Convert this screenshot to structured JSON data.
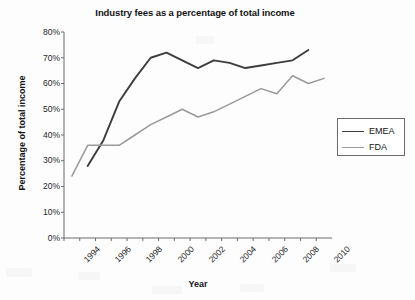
{
  "chart_data": {
    "type": "line",
    "title": "Industry fees as a percentage of total income",
    "xlabel": "Year",
    "ylabel": "Percentage of total income",
    "xlim": [
      1994,
      2011
    ],
    "ylim": [
      0,
      80
    ],
    "yticks": [
      "0%",
      "10%",
      "20%",
      "30%",
      "40%",
      "50%",
      "60%",
      "70%",
      "80%"
    ],
    "ytick_values": [
      0,
      10,
      20,
      30,
      40,
      50,
      60,
      70,
      80
    ],
    "xticks": [
      "1994",
      "1996",
      "1998",
      "2000",
      "2002",
      "2004",
      "2006",
      "2008",
      "2010"
    ],
    "xtick_values": [
      1994,
      1996,
      1998,
      2000,
      2002,
      2004,
      2006,
      2008,
      2010
    ],
    "grid": false,
    "legend_position": "right",
    "series": [
      {
        "name": "EMEA",
        "color": "#3d3d3d",
        "line_width": 1.9,
        "x": [
          1995.5,
          1996.5,
          1997.5,
          1998.5,
          1999.5,
          2000.5,
          2001.5,
          2002.5,
          2003.5,
          2004.5,
          2005.5,
          2006.5,
          2007.5,
          2008.5,
          2009.5
        ],
        "values": [
          28,
          38,
          53,
          62,
          70,
          72,
          69,
          66,
          69,
          68,
          66,
          67,
          68,
          69,
          73
        ]
      },
      {
        "name": "FDA",
        "color": "#9a9a9a",
        "line_width": 1.5,
        "x": [
          1994.5,
          1995.5,
          1996.5,
          1997.5,
          1998.5,
          1999.5,
          2000.5,
          2001.5,
          2002.5,
          2003.5,
          2004.5,
          2005.5,
          2006.5,
          2007.5,
          2008.5,
          2009.5,
          2010.5
        ],
        "values": [
          24,
          36,
          36,
          36,
          40,
          44,
          47,
          50,
          47,
          49,
          52,
          55,
          58,
          56,
          63,
          60,
          62
        ]
      }
    ]
  },
  "legend": {
    "items": [
      {
        "label": "EMEA"
      },
      {
        "label": "FDA"
      }
    ]
  },
  "axes": {
    "axis_color": "#6b6b6b"
  }
}
